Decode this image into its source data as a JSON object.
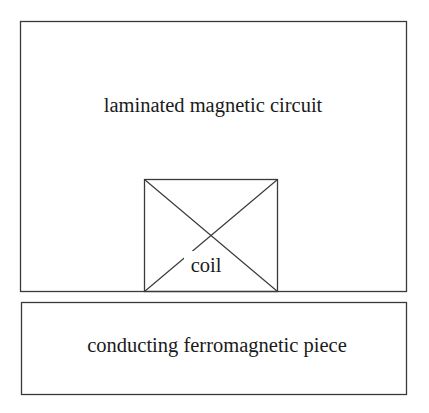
{
  "diagram": {
    "magnetic_circuit": {
      "label": "laminated magnetic circuit",
      "x": 20,
      "y": 21,
      "width": 386,
      "height": 270
    },
    "coil": {
      "label": "coil",
      "x": 144,
      "y": 179,
      "width": 133,
      "height": 112,
      "symbol": "cross-in-box"
    },
    "workpiece": {
      "label": "conducting ferromagnetic piece",
      "x": 21,
      "y": 302,
      "width": 385,
      "height": 92
    },
    "colors": {
      "stroke": "#3a3a3a",
      "text": "#1a1a1a",
      "background": "#ffffff"
    }
  }
}
